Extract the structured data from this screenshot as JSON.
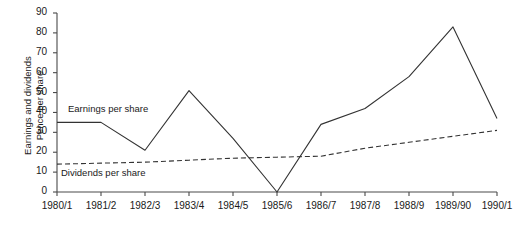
{
  "chart_data": {
    "type": "line",
    "title": "",
    "xlabel": "",
    "ylabel": "Earnings and dividends Pence per share",
    "ylabel_lines": [
      "Earnings and dividends",
      "Pence per share"
    ],
    "ylim": [
      0,
      90
    ],
    "ytick_step": 10,
    "yticks": [
      0,
      10,
      20,
      30,
      40,
      50,
      60,
      70,
      80,
      90
    ],
    "ytick_labels": [
      "0",
      "10",
      "20",
      "30",
      "40",
      "50",
      "60",
      "70",
      "80",
      "90"
    ],
    "categories": [
      "1980/1",
      "1981/2",
      "1982/3",
      "1983/4",
      "1984/5",
      "1985/6",
      "1986/7",
      "1987/8",
      "1988/9",
      "1989/90",
      "1990/1"
    ],
    "grid": false,
    "legend_position": "inline-annotations",
    "series": [
      {
        "name": "Earnings per share",
        "style": "solid",
        "color": "#333333",
        "values": [
          35,
          35,
          21,
          51,
          27,
          0,
          34,
          42,
          58,
          83,
          37
        ]
      },
      {
        "name": "Dividends per share",
        "style": "dashed",
        "color": "#333333",
        "values": [
          14,
          14.5,
          15,
          16,
          17,
          17.5,
          18,
          22,
          25,
          28,
          31
        ]
      }
    ],
    "annotations": [
      {
        "text": "Earnings per share",
        "series": "Earnings per share"
      },
      {
        "text": "Dividends per share",
        "series": "Dividends per share"
      }
    ]
  },
  "axis": {
    "y_title_line1": "Earnings and dividends",
    "y_title_line2": "Pence per share"
  }
}
